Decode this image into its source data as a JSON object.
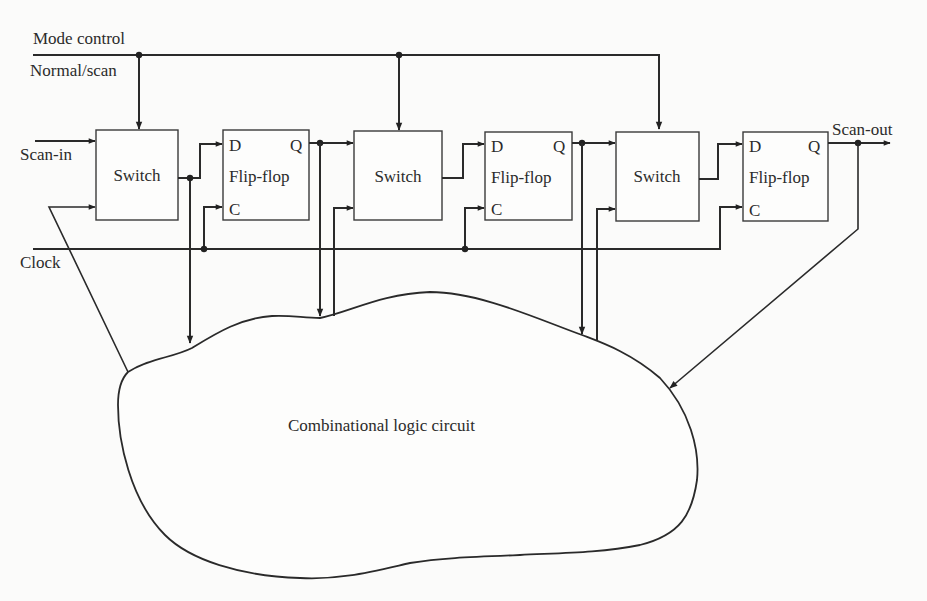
{
  "labels": {
    "mode_control": "Mode control",
    "normal_scan": "Normal/scan",
    "scan_in": "Scan-in",
    "clock": "Clock",
    "scan_out": "Scan-out",
    "combinational": "Combinational logic circuit"
  },
  "stages": [
    {
      "switch_label": "Switch",
      "ff_label": "Flip-flop",
      "d_pin": "D",
      "q_pin": "Q",
      "c_pin": "C"
    },
    {
      "switch_label": "Switch",
      "ff_label": "Flip-flop",
      "d_pin": "D",
      "q_pin": "Q",
      "c_pin": "C"
    },
    {
      "switch_label": "Switch",
      "ff_label": "Flip-flop",
      "d_pin": "D",
      "q_pin": "Q",
      "c_pin": "C"
    }
  ],
  "colors": {
    "ink": "#2a2a2a",
    "paper": "#fbfbfa"
  }
}
